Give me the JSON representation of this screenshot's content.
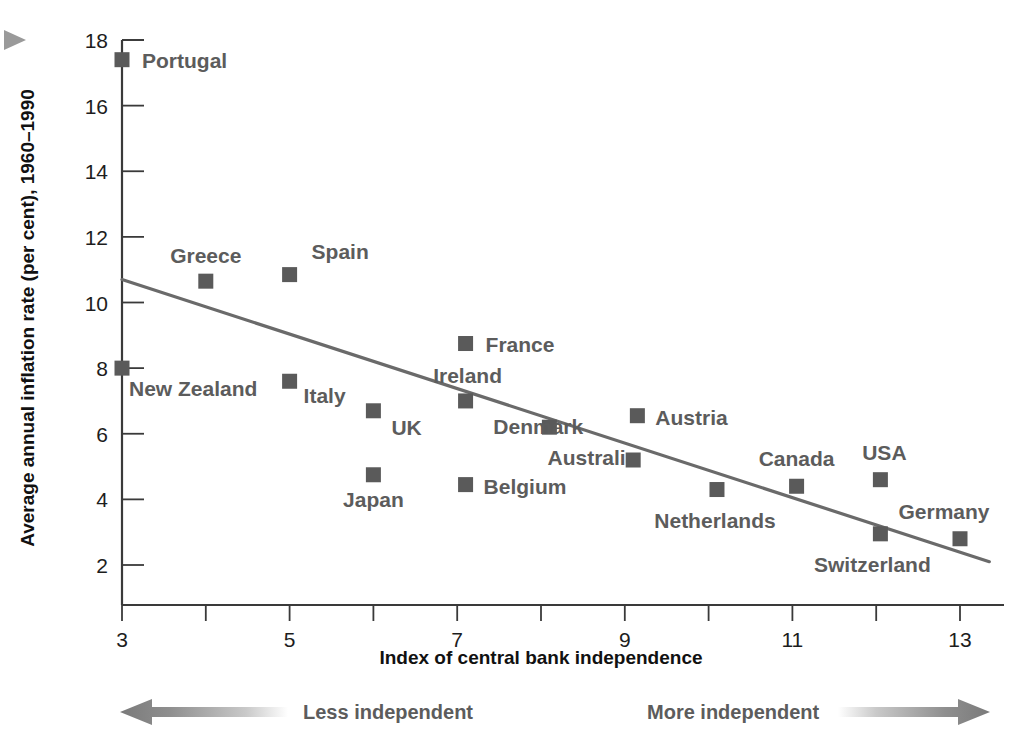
{
  "chart_data": {
    "type": "scatter",
    "title": "",
    "xlabel": "Index of central bank independence",
    "ylabel": "Average annual inflation rate (per cent), 1960–1990",
    "xlim": [
      3,
      13
    ],
    "ylim": [
      0,
      18
    ],
    "grid": false,
    "legend": "none",
    "x_ticks": [
      3,
      4,
      5,
      6,
      7,
      8,
      9,
      10,
      11,
      12,
      13
    ],
    "x_tick_labels": [
      "3",
      "",
      "5",
      "",
      "7",
      "",
      "9",
      "",
      "11",
      "",
      "13"
    ],
    "y_ticks": [
      2,
      4,
      6,
      8,
      10,
      12,
      14,
      16,
      18
    ],
    "y_tick_labels": [
      "2",
      "4",
      "6",
      "8",
      "10",
      "12",
      "14",
      "16",
      "18"
    ],
    "marker_color": "#5a5a5a",
    "trendline": {
      "label": "fitted regression line",
      "color": "#6a6a6a",
      "x0": 3.0,
      "y0": 10.7,
      "x1": 13.35,
      "y1": 2.1
    },
    "points": [
      {
        "label": "Portugal",
        "x": 3.0,
        "y": 17.4,
        "label_dx": 20,
        "label_dy": 8,
        "anchor": "start"
      },
      {
        "label": "New Zealand",
        "x": 3.0,
        "y": 8.0,
        "label_dx": 7,
        "label_dy": 28,
        "anchor": "start"
      },
      {
        "label": "Greece",
        "x": 4.0,
        "y": 10.65,
        "label_dx": 0,
        "label_dy": -18,
        "anchor": "middle"
      },
      {
        "label": "Spain",
        "x": 5.0,
        "y": 10.85,
        "label_dx": 22,
        "label_dy": -16,
        "anchor": "start"
      },
      {
        "label": "Italy",
        "x": 5.0,
        "y": 7.6,
        "label_dx": 14,
        "label_dy": 22,
        "anchor": "start"
      },
      {
        "label": "UK",
        "x": 6.0,
        "y": 6.7,
        "label_dx": 18,
        "label_dy": 24,
        "anchor": "start"
      },
      {
        "label": "Japan",
        "x": 6.0,
        "y": 4.75,
        "label_dx": 0,
        "label_dy": 32,
        "anchor": "middle"
      },
      {
        "label": "France",
        "x": 7.1,
        "y": 8.75,
        "label_dx": 20,
        "label_dy": 8,
        "anchor": "start"
      },
      {
        "label": "Ireland",
        "x": 7.1,
        "y": 7.0,
        "label_dx": 2,
        "label_dy": -18,
        "anchor": "middle"
      },
      {
        "label": "Belgium",
        "x": 7.1,
        "y": 4.45,
        "label_dx": 18,
        "label_dy": 9,
        "anchor": "start"
      },
      {
        "label": "Australia",
        "x": 8.1,
        "y": 6.2,
        "label_dx": 88,
        "label_dy": 38,
        "anchor": "end"
      },
      {
        "label": "Denmark",
        "x": 9.1,
        "y": 5.2,
        "label_dx": -50,
        "label_dy": -26,
        "anchor": "end"
      },
      {
        "label": "Austria",
        "x": 9.15,
        "y": 6.55,
        "label_dx": 18,
        "label_dy": 9,
        "anchor": "start"
      },
      {
        "label": "Netherlands",
        "x": 10.1,
        "y": 4.3,
        "label_dx": -2,
        "label_dy": 38,
        "anchor": "middle"
      },
      {
        "label": "Canada",
        "x": 11.05,
        "y": 4.4,
        "label_dx": 0,
        "label_dy": -20,
        "anchor": "middle"
      },
      {
        "label": "USA",
        "x": 12.05,
        "y": 4.6,
        "label_dx": 4,
        "label_dy": -20,
        "anchor": "middle"
      },
      {
        "label": "Switzerland",
        "x": 12.05,
        "y": 2.95,
        "label_dx": -8,
        "label_dy": 38,
        "anchor": "middle"
      },
      {
        "label": "Germany",
        "x": 13.0,
        "y": 2.8,
        "label_dx": -16,
        "label_dy": -20,
        "anchor": "middle"
      }
    ]
  },
  "scale_annotations": {
    "left": {
      "label": "Less independent",
      "direction": "left"
    },
    "right": {
      "label": "More independent",
      "direction": "right"
    }
  },
  "bullet_marker": {
    "name": "play-triangle-icon"
  }
}
